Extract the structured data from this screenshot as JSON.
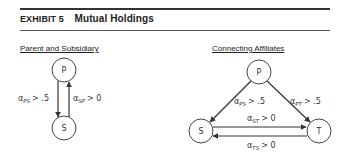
{
  "header": {
    "exhibit_number": "EXHIBIT 5",
    "title": "Mutual Holdings"
  },
  "diagrams": [
    {
      "title": "Parent and Subsidiary",
      "nodes": [
        {
          "id": "P",
          "label": "P"
        },
        {
          "id": "S",
          "label": "S"
        }
      ],
      "edges": [
        {
          "from": "P",
          "to": "S",
          "symbol": "α",
          "subscript": "PS",
          "condition": "> .5"
        },
        {
          "from": "S",
          "to": "P",
          "symbol": "α",
          "subscript": "SP",
          "condition": "> 0"
        }
      ]
    },
    {
      "title": "Connecting Affiliates",
      "nodes": [
        {
          "id": "P",
          "label": "P"
        },
        {
          "id": "S",
          "label": "S"
        },
        {
          "id": "T",
          "label": "T"
        }
      ],
      "edges": [
        {
          "from": "P",
          "to": "S",
          "symbol": "α",
          "subscript": "PS",
          "condition": "> .5"
        },
        {
          "from": "P",
          "to": "T",
          "symbol": "α",
          "subscript": "PT",
          "condition": "> .5"
        },
        {
          "from": "S",
          "to": "T",
          "symbol": "α",
          "subscript": "ST",
          "condition": "> 0"
        },
        {
          "from": "T",
          "to": "S",
          "symbol": "α",
          "subscript": "TS",
          "condition": "> 0"
        }
      ]
    }
  ]
}
